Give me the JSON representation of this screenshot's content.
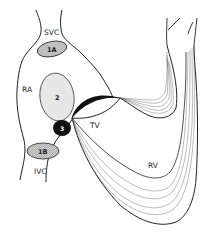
{
  "diagram": {
    "type": "anatomical schematic",
    "labels": {
      "svc": "SVC",
      "ra": "RA",
      "ivc": "IVC",
      "tv": "TV",
      "rv": "RV"
    },
    "regions": [
      {
        "id": "1A",
        "label": "1A",
        "style": "hatched gray oval"
      },
      {
        "id": "1B",
        "label": "1B",
        "style": "hatched gray oval"
      },
      {
        "id": "2",
        "label": "2",
        "style": "light dotted oval"
      },
      {
        "id": "3",
        "label": "3",
        "style": "solid black circle"
      },
      {
        "id": "4",
        "label": "4",
        "style": "black crescent"
      }
    ],
    "colors": {
      "line": "#222222",
      "hatch_fill": "#c8c8c8",
      "dot_fill": "#e6e6e6",
      "solid": "#111111",
      "background": "#ffffff"
    }
  }
}
